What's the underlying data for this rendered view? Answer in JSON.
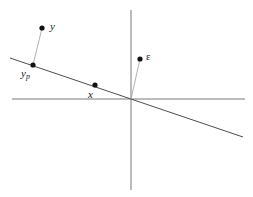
{
  "figure": {
    "kind": "orthogonal-projection-diagram",
    "width": 253,
    "height": 197,
    "background_color": "#ffffff"
  },
  "chart_data": {
    "type": "scatter",
    "title": "",
    "xlabel": "",
    "ylabel": "",
    "grid": false,
    "legend": "none",
    "axes": {
      "origin": [
        131,
        99
      ],
      "x_axis": {
        "from": [
          12,
          99
        ],
        "to": [
          245,
          99
        ],
        "color": "#7a7a7a"
      },
      "y_axis": {
        "from": [
          131,
          10
        ],
        "to": [
          131,
          190
        ],
        "color": "#7a7a7a"
      }
    },
    "lines": [
      {
        "name": "subspace-line",
        "style": "solid",
        "color": "#4d4d4d",
        "from": [
          10,
          58
        ],
        "to": [
          243,
          137
        ]
      },
      {
        "name": "residual-connector",
        "style": "solid-thin",
        "color": "#a8a8a8",
        "from": [
          42,
          28
        ],
        "to": [
          33,
          65
        ]
      },
      {
        "name": "epsilon-connector",
        "style": "solid-thin",
        "color": "#a8a8a8",
        "from": [
          131,
          99
        ],
        "to": [
          140,
          59
        ]
      }
    ],
    "points": [
      {
        "id": "y",
        "label": "y",
        "subscript": "",
        "x": 42,
        "y": 28,
        "label_x": 50,
        "label_y": 21
      },
      {
        "id": "y_p",
        "label": "y",
        "subscript": "p",
        "x": 33,
        "y": 65,
        "label_x": 21,
        "label_y": 68
      },
      {
        "id": "x",
        "label": "x",
        "subscript": "",
        "x": 95,
        "y": 85,
        "label_x": 88,
        "label_y": 89
      },
      {
        "id": "epsilon",
        "label": "ε",
        "subscript": "",
        "x": 140,
        "y": 59,
        "label_x": 146,
        "label_y": 51
      }
    ],
    "point_color": "#111111",
    "point_radius": 2.6
  },
  "labels": {
    "y": "y",
    "y_p_base": "y",
    "y_p_sub": "p",
    "x": "x",
    "epsilon": "ε"
  }
}
